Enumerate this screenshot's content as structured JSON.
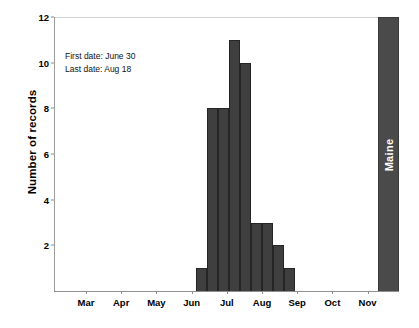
{
  "chart_data": {
    "type": "bar",
    "title": "",
    "subtitle": "",
    "xlabel": "",
    "ylabel": "Number of records",
    "ylim": [
      0,
      12
    ],
    "ytick_labels": [
      "2",
      "4",
      "6",
      "8",
      "10",
      "12"
    ],
    "ytick_values": [
      2,
      4,
      6,
      8,
      10,
      12
    ],
    "xtick_labels": [
      "Mar",
      "Apr",
      "May",
      "Jun",
      "Jul",
      "Aug",
      "Sep",
      "Oct",
      "Nov"
    ],
    "grid": false,
    "legend": "none",
    "bar_color": "#3f3f3f",
    "bar_edge_color": "#252525",
    "categories": [
      "Jun 30",
      "Jul 7",
      "Jul 14",
      "Jul 21",
      "Jul 28",
      "Aug 4",
      "Aug 11",
      "Aug 18",
      "Aug 25"
    ],
    "values": [
      1,
      8,
      8,
      11,
      10,
      3,
      3,
      2,
      1
    ],
    "bars": [
      {
        "name": "bin-1",
        "value": 1,
        "x_left": 196,
        "width": 11
      },
      {
        "name": "bin-2",
        "value": 8,
        "x_left": 207,
        "width": 11
      },
      {
        "name": "bin-3",
        "value": 8,
        "x_left": 218,
        "width": 11
      },
      {
        "name": "bin-4",
        "value": 11,
        "x_left": 229,
        "width": 11
      },
      {
        "name": "bin-5",
        "value": 10,
        "x_left": 240,
        "width": 11
      },
      {
        "name": "bin-6",
        "value": 3,
        "x_left": 251,
        "width": 11
      },
      {
        "name": "bin-7",
        "value": 3,
        "x_left": 262,
        "width": 11
      },
      {
        "name": "bin-8",
        "value": 2,
        "x_left": 273,
        "width": 11
      },
      {
        "name": "bin-9",
        "value": 1,
        "x_left": 284,
        "width": 11
      }
    ],
    "highlight_bar": {
      "label": "Maine",
      "value": 12,
      "x_left": 378,
      "width": 21,
      "color": "#4a4a4a"
    },
    "annotations": [
      "First date: June 30",
      "Last date: Aug 18"
    ]
  },
  "annotation": {
    "first_date_line": "First date: June 30",
    "last_date_line": "Last date: Aug 18"
  },
  "axes": {
    "y_title": "Number of records"
  }
}
